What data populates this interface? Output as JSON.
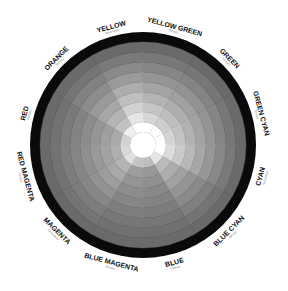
{
  "diagram": {
    "center": [
      143,
      145
    ],
    "outer_radius": 113,
    "black_ring_width": 10,
    "inner_white_radius": 13,
    "ring_count": 9,
    "start_angle_deg": -30,
    "segment_span_deg": 30,
    "colors": {
      "outer_ring": "#0a0a0a",
      "center": "#ffffff",
      "label": "#111111",
      "sublabel": "#777777"
    },
    "segments": [
      {
        "name": "YELLOW",
        "type": "Secondary",
        "lightness": 0.97
      },
      {
        "name": "YELLOW GREEN",
        "type": "Tertiary",
        "lightness": 0.86
      },
      {
        "name": "GREEN",
        "type": "Primary",
        "lightness": 0.8
      },
      {
        "name": "GREEN CYAN",
        "type": "Tertiary",
        "lightness": 0.84
      },
      {
        "name": "CYAN",
        "type": "Secondary",
        "lightness": 0.9
      },
      {
        "name": "BLUE CYAN",
        "type": "Tertiary",
        "lightness": 0.66
      },
      {
        "name": "BLUE",
        "type": "Primary",
        "lightness": 0.42
      },
      {
        "name": "BLUE MAGENTA",
        "type": "Tertiary",
        "lightness": 0.46
      },
      {
        "name": "MAGENTA",
        "type": "Secondary",
        "lightness": 0.62
      },
      {
        "name": "RED MAGENTA",
        "type": "Tertiary",
        "lightness": 0.58
      },
      {
        "name": "RED",
        "type": "Primary",
        "lightness": 0.54
      },
      {
        "name": "ORANGE",
        "type": "Tertiary",
        "lightness": 0.72
      }
    ]
  }
}
